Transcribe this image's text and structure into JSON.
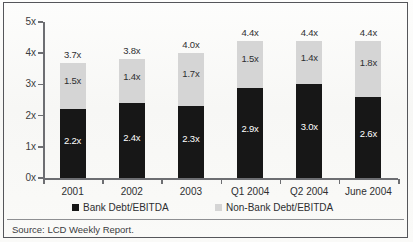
{
  "chart_data": {
    "type": "bar",
    "title": "",
    "xlabel": "",
    "ylabel": "",
    "ylim": [
      0,
      5
    ],
    "ytick_labels": [
      "0x",
      "1x",
      "2x",
      "3x",
      "4x",
      "5x"
    ],
    "ytick_values": [
      0,
      1,
      2,
      3,
      4,
      5
    ],
    "grid": false,
    "stacked": true,
    "legend_position": "bottom",
    "categories": [
      "2001",
      "2002",
      "2003",
      "Q1 2004",
      "Q2 2004",
      "June 2004"
    ],
    "series": [
      {
        "name": "Bank Debt/EBITDA",
        "color": "#171717",
        "values": [
          2.2,
          2.4,
          2.3,
          2.9,
          3.0,
          2.6
        ],
        "labels": [
          "2.2x",
          "2.4x",
          "2.3x",
          "2.9x",
          "3.0x",
          "2.6x"
        ]
      },
      {
        "name": "Non-Bank Debt/EBITDA",
        "color": "#d5d5d5",
        "values": [
          1.5,
          1.4,
          1.7,
          1.5,
          1.4,
          1.8
        ],
        "labels": [
          "1.5x",
          "1.4x",
          "1.7x",
          "1.5x",
          "1.4x",
          "1.8x"
        ]
      }
    ],
    "totals": [
      3.7,
      3.8,
      4.0,
      4.4,
      4.4,
      4.4
    ],
    "total_labels": [
      "3.7x",
      "3.8x",
      "4.0x",
      "4.4x",
      "4.4x",
      "4.4x"
    ]
  },
  "legend": {
    "items": [
      {
        "label": "Bank Debt/EBITDA",
        "color": "#171717"
      },
      {
        "label": "Non-Bank Debt/EBITDA",
        "color": "#d5d5d5"
      }
    ]
  },
  "footer": {
    "source": "Source: LCD Weekly Report."
  }
}
